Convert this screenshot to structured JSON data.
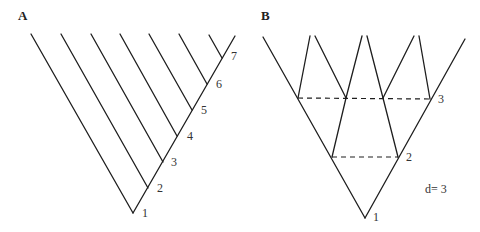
{
  "panels": [
    {
      "label": "A",
      "description": "Pectinate (ladder-like) tree",
      "node_labels": [
        "1",
        "2",
        "3",
        "4",
        "5",
        "6",
        "7"
      ]
    },
    {
      "label": "B",
      "description": "Balanced (symmetric) tree",
      "node_labels": [
        "1",
        "2",
        "3"
      ],
      "annotation": "d= 3"
    }
  ],
  "colors": {
    "line": "#1e1e1e",
    "text": "#333333",
    "background": "#ffffff"
  }
}
